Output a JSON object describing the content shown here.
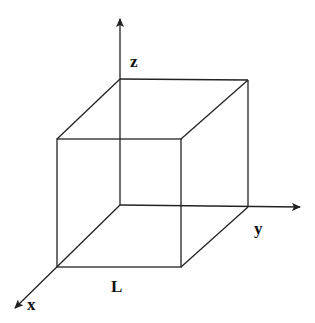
{
  "diagram": {
    "type": "3d-cube-with-axes",
    "stroke_color": "#222222",
    "background": "#ffffff",
    "labels": {
      "z_axis": "z",
      "y_axis": "y",
      "x_axis": "x",
      "side_length": "L"
    },
    "axes": [
      {
        "name": "z",
        "from": [
          120,
          205
        ],
        "to": [
          120,
          17
        ]
      },
      {
        "name": "y",
        "from": [
          120,
          205
        ],
        "to": [
          302,
          207
        ]
      },
      {
        "name": "x",
        "from": [
          120,
          205
        ],
        "to": [
          13,
          310
        ]
      }
    ]
  }
}
